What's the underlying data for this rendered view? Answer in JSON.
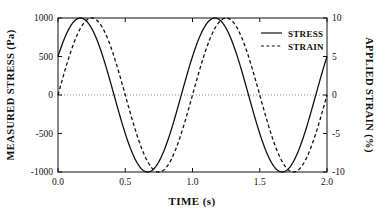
{
  "chart_data": {
    "type": "line",
    "title": "",
    "xlabel": "TIME (s)",
    "ylabel": "MEASURED STRESS (Pa)",
    "y2label": "APPLIED STRAIN (%)",
    "xlim": [
      0.0,
      2.0
    ],
    "ylim": [
      -1000,
      1000
    ],
    "y2lim": [
      -10,
      10
    ],
    "xticks": [
      "0.0",
      "0.5",
      "1.0",
      "1.5",
      "2.0"
    ],
    "xtick_values": [
      0.0,
      0.5,
      1.0,
      1.5,
      2.0
    ],
    "yticks": [
      "1000",
      "500",
      "0",
      "-500",
      "-1000"
    ],
    "ytick_values": [
      1000,
      500,
      0,
      -500,
      -1000
    ],
    "y2ticks": [
      "10",
      "5",
      "0",
      "-5",
      "-10"
    ],
    "y2tick_values": [
      10,
      5,
      0,
      -5,
      -10
    ],
    "grid": false,
    "zero_line": true,
    "legend_position": "top-right",
    "series": [
      {
        "name": "STRESS",
        "axis": "left",
        "style": "solid",
        "color": "#111111",
        "amplitude": 1000,
        "period": 1.0,
        "phase_deg": 30,
        "unit": "Pa",
        "x": [
          0.0,
          0.05,
          0.1,
          0.15,
          0.2,
          0.25,
          0.3,
          0.35,
          0.4,
          0.45,
          0.5,
          0.55,
          0.6,
          0.65,
          0.7,
          0.75,
          0.8,
          0.85,
          0.9,
          0.95,
          1.0,
          1.05,
          1.1,
          1.15,
          1.2,
          1.25,
          1.3,
          1.35,
          1.4,
          1.45,
          1.5,
          1.55,
          1.6,
          1.65,
          1.7,
          1.75,
          1.8,
          1.85,
          1.9,
          1.95,
          2.0
        ],
        "values": [
          500,
          707,
          866,
          966,
          1000,
          966,
          866,
          707,
          500,
          259,
          0,
          -259,
          -500,
          -707,
          -866,
          -966,
          -1000,
          -966,
          -866,
          -707,
          -500,
          -259,
          0,
          259,
          500,
          707,
          866,
          966,
          1000,
          966,
          866,
          707,
          500,
          259,
          0,
          -259,
          -500,
          -707,
          -866,
          -966,
          -1000
        ]
      },
      {
        "name": "STRAIN",
        "axis": "right",
        "style": "dashed",
        "color": "#111111",
        "amplitude": 10,
        "period": 1.0,
        "phase_deg": 0,
        "unit": "%",
        "x": [
          0.0,
          0.05,
          0.1,
          0.15,
          0.2,
          0.25,
          0.3,
          0.35,
          0.4,
          0.45,
          0.5,
          0.55,
          0.6,
          0.65,
          0.7,
          0.75,
          0.8,
          0.85,
          0.9,
          0.95,
          1.0,
          1.05,
          1.1,
          1.15,
          1.2,
          1.25,
          1.3,
          1.35,
          1.4,
          1.45,
          1.5,
          1.55,
          1.6,
          1.65,
          1.7,
          1.75,
          1.8,
          1.85,
          1.9,
          1.95,
          2.0
        ],
        "values": [
          0,
          3.09,
          5.88,
          8.09,
          9.51,
          10,
          9.51,
          8.09,
          5.88,
          3.09,
          0,
          -3.09,
          -5.88,
          -8.09,
          -9.51,
          -10,
          -9.51,
          -8.09,
          -5.88,
          -3.09,
          0,
          3.09,
          5.88,
          8.09,
          9.51,
          10,
          9.51,
          8.09,
          5.88,
          3.09,
          0,
          -3.09,
          -5.88,
          -8.09,
          -9.51,
          -10,
          -9.51,
          -8.09,
          -5.88,
          -3.09,
          0
        ]
      }
    ],
    "annotations": [],
    "note": "STRESS leads STRAIN by 30 degrees; both are sinusoids of period 1.0 s."
  },
  "legend": {
    "entries": [
      {
        "label": "STRESS",
        "style": "solid"
      },
      {
        "label": "STRAIN",
        "style": "dashed"
      }
    ]
  },
  "axes": {
    "x_title": "TIME (s)",
    "y_left_title": "MEASURED STRESS (Pa)",
    "y_right_title": "APPLIED STRAIN (%)"
  }
}
